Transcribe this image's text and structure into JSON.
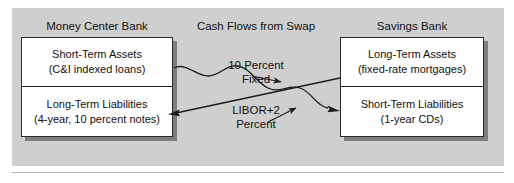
{
  "figure": {
    "center_title": "Cash Flows from Swap"
  },
  "left_bank": {
    "title": "Money Center Bank",
    "assets": {
      "line1": "Short-Term Assets",
      "line2": "(C&I indexed loans)"
    },
    "liabilities": {
      "line1": "Long-Term Liabilities",
      "line2": "(4-year, 10 percent notes)"
    }
  },
  "right_bank": {
    "title": "Savings Bank",
    "assets": {
      "line1": "Long-Term Assets",
      "line2": "(fixed-rate mortgages)"
    },
    "liabilities": {
      "line1": "Short-Term Liabilities",
      "line2": "(1-year CDs)"
    }
  },
  "flows": {
    "fixed": {
      "line1": "10 Percent",
      "line2": "Fixed"
    },
    "floating": {
      "line1": "LIBOR+2",
      "line2": "Percent"
    }
  },
  "colors": {
    "panel_background": "#cfcfcf",
    "box_background": "#ffffff",
    "box_border": "#2a2a2a",
    "text": "#111111",
    "arrow": "#1c1c1c"
  }
}
